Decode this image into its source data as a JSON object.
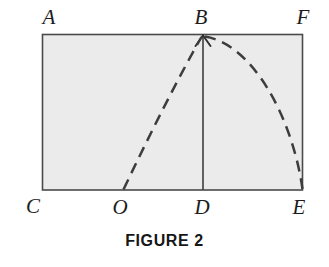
{
  "figure": {
    "caption": "FIGURE 2",
    "colors": {
      "rect_fill": "#ebebeb",
      "stroke": "#4a4a4a",
      "dash": "#3d3d3d",
      "label": "#1c1c1c",
      "background": "#ffffff"
    },
    "rectangle": {
      "name": "ACEF",
      "left": 42,
      "top": 34,
      "right": 303,
      "bottom": 190
    },
    "labels": [
      {
        "id": "A",
        "text": "A",
        "x": 49,
        "y": 17,
        "role": "top-left-corner"
      },
      {
        "id": "B",
        "text": "B",
        "x": 201,
        "y": 17,
        "role": "apex-on-top-edge"
      },
      {
        "id": "F",
        "text": "F",
        "x": 303,
        "y": 17,
        "role": "top-right-corner"
      },
      {
        "id": "C",
        "text": "C",
        "x": 33,
        "y": 206,
        "role": "bottom-left-corner"
      },
      {
        "id": "O",
        "text": "O",
        "x": 120,
        "y": 207,
        "role": "curve-origin-on-bottom-edge"
      },
      {
        "id": "D",
        "text": "D",
        "x": 202,
        "y": 207,
        "role": "foot-of-vertical"
      },
      {
        "id": "E",
        "text": "E",
        "x": 299,
        "y": 207,
        "role": "bottom-right-corner"
      }
    ],
    "points": {
      "A": {
        "x": 42,
        "y": 34
      },
      "B": {
        "x": 203,
        "y": 35
      },
      "F": {
        "x": 303,
        "y": 34
      },
      "C": {
        "x": 42,
        "y": 190
      },
      "O": {
        "x": 123,
        "y": 190
      },
      "D": {
        "x": 203,
        "y": 190
      },
      "E": {
        "x": 303,
        "y": 190
      }
    },
    "segments": [
      {
        "id": "BD",
        "from": "B",
        "to": "D",
        "style": "solid",
        "arrow_at": "B"
      }
    ],
    "curve": {
      "id": "trajectory-OBE",
      "style": "dashed",
      "dash_pattern": "11 7",
      "from": "O",
      "apex": "B",
      "to": "E",
      "left_control": {
        "x": 168,
        "y": 96
      },
      "right_control": {
        "x": 252,
        "y": 44
      },
      "right_control2": {
        "x": 292,
        "y": 116
      }
    }
  }
}
